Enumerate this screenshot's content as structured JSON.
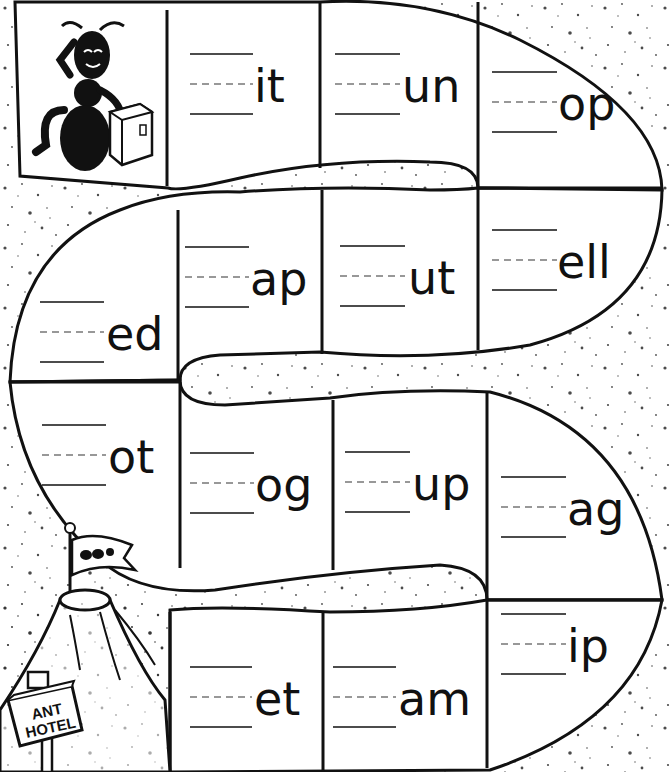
{
  "worksheet": {
    "title": "Word family game board",
    "start_label": "ant-start",
    "finish_sign": {
      "line1": "ANT",
      "line2": "HOTEL"
    },
    "ink_color": "#111111",
    "paper_color": "#ffffff",
    "cells": [
      {
        "id": 1,
        "row": 1,
        "ending": "it"
      },
      {
        "id": 2,
        "row": 1,
        "ending": "un"
      },
      {
        "id": 3,
        "row": 1,
        "ending": "op"
      },
      {
        "id": 4,
        "row": 2,
        "ending": "ell"
      },
      {
        "id": 5,
        "row": 2,
        "ending": "ut"
      },
      {
        "id": 6,
        "row": 2,
        "ending": "ap"
      },
      {
        "id": 7,
        "row": 2,
        "ending": "ed"
      },
      {
        "id": 8,
        "row": 3,
        "ending": "ot"
      },
      {
        "id": 9,
        "row": 3,
        "ending": "og"
      },
      {
        "id": 10,
        "row": 3,
        "ending": "up"
      },
      {
        "id": 11,
        "row": 3,
        "ending": "ag"
      },
      {
        "id": 12,
        "row": 4,
        "ending": "ip"
      },
      {
        "id": 13,
        "row": 4,
        "ending": "am"
      },
      {
        "id": 14,
        "row": 4,
        "ending": "et"
      }
    ]
  }
}
